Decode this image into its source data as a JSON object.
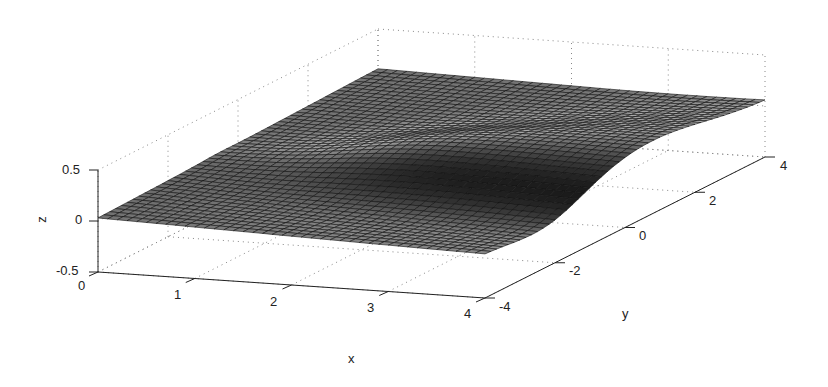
{
  "chart_data": {
    "type": "surface",
    "title": "",
    "xlabel": "x",
    "ylabel": "y",
    "zlabel": "z",
    "xlim": [
      0,
      4
    ],
    "ylim": [
      -4,
      4
    ],
    "zlim": [
      -0.5,
      0.5
    ],
    "xticks": [
      "0",
      "1",
      "2",
      "3",
      "4"
    ],
    "yticks": [
      "-4",
      "-2",
      "0",
      "2",
      "4"
    ],
    "zticks": [
      "-0.5",
      "0",
      "0.5"
    ],
    "grid": true,
    "colormap": "gray"
  },
  "labels": {
    "x": "x",
    "y": "y",
    "z": "z",
    "xticks": [
      "0",
      "1",
      "2",
      "3",
      "4"
    ],
    "yticks": [
      "-4",
      "-2",
      "0",
      "2",
      "4"
    ],
    "zticks": [
      "-0.5",
      "0",
      "0.5"
    ]
  }
}
